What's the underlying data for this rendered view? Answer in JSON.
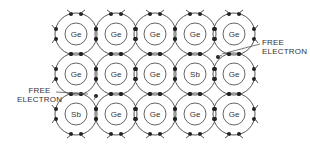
{
  "diagram": {
    "grid": {
      "cols": 5,
      "rows": 3
    },
    "atoms": [
      [
        "Ge",
        "Ge",
        "Ge",
        "Ge",
        "Ge"
      ],
      [
        "Ge",
        "Ge",
        "Ge",
        "Sb",
        "Ge"
      ],
      [
        "Sb",
        "Ge",
        "Ge",
        "Ge",
        "Ge"
      ]
    ],
    "labels": {
      "free_electron_right_line1": "FREE",
      "free_electron_right_line2": "ELECTRON",
      "free_electron_left_line1": "FREE",
      "free_electron_left_line2": "ELECTRON"
    },
    "colors": {
      "stroke": "#555555",
      "electron": "#222222",
      "text": "#333333"
    }
  }
}
